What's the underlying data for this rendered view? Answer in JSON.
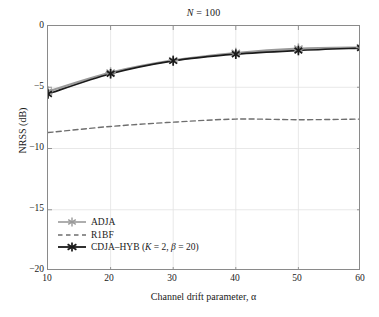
{
  "chart_data": {
    "type": "line",
    "title": "N = 100",
    "xlabel": "Channel drift parameter, α",
    "ylabel": "NRSS (dB)",
    "xlim": [
      10,
      60
    ],
    "ylim": [
      -20,
      0
    ],
    "xticks": [
      "10",
      "20",
      "30",
      "40",
      "50",
      "60"
    ],
    "xtick_values": [
      10,
      20,
      30,
      40,
      50,
      60
    ],
    "yticks": [
      "0",
      "−5",
      "−10",
      "−15",
      "−20"
    ],
    "ytick_values": [
      0,
      -5,
      -10,
      -15,
      -20
    ],
    "grid": true,
    "legend_position": "lower-left",
    "x": [
      10,
      20,
      30,
      40,
      50,
      60
    ],
    "series": [
      {
        "name": "ADJA",
        "label": "ADJA",
        "color": "#9a9a9a",
        "style": "solid",
        "marker": "asterisk",
        "values": [
          -5.35,
          -3.8,
          -2.8,
          -2.2,
          -1.85,
          -1.75
        ]
      },
      {
        "name": "R1BF",
        "label": "R1BF",
        "color": "#6e6e6e",
        "style": "dashed",
        "marker": "none",
        "values": [
          -8.7,
          -8.2,
          -7.85,
          -7.6,
          -7.65,
          -7.6
        ]
      },
      {
        "name": "CDJA-HYB",
        "label": "CDJA–HYB (K = 2, β = 20)",
        "label_plain": "CDJA-HYB (K = 2, beta = 20)",
        "color": "#1a1a1a",
        "style": "solid",
        "marker": "x-asterisk",
        "values": [
          -5.55,
          -3.9,
          -2.85,
          -2.3,
          -2.0,
          -1.8
        ]
      }
    ]
  },
  "legend": {
    "items": [
      {
        "label": "ADJA"
      },
      {
        "label": "R1BF"
      },
      {
        "label": "CDJA–HYB (K = 2, β = 20)"
      }
    ]
  },
  "colors": {
    "axis": "#8a8a8a",
    "grid": "#e2e2e2",
    "text": "#1a1a1a",
    "adja": "#9a9a9a",
    "r1bf": "#6e6e6e",
    "cdja": "#1a1a1a"
  }
}
